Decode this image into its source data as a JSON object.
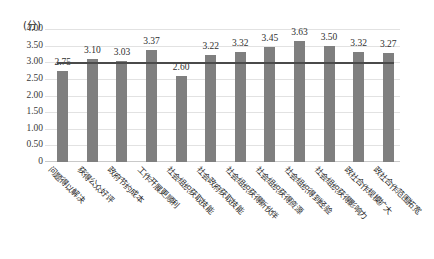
{
  "chart_data": {
    "type": "bar",
    "title": "",
    "subtitle": "",
    "xlabel": "",
    "ylabel": "(分)",
    "ylim": [
      0,
      4.0
    ],
    "grid": true,
    "legend": null,
    "categories": [
      "问题得以解决",
      "获得公众好评",
      "政府节约成本",
      "工作开展更顺利",
      "社会组织获取技能",
      "社会政府获取技能",
      "社会组织获得新伙伴",
      "社会组织获得资源",
      "社会组织得到经验",
      "社会组织获得影响力",
      "政社合作规模扩大",
      "政社合作范围拓宽"
    ],
    "values": [
      2.75,
      3.1,
      3.03,
      3.37,
      2.6,
      3.22,
      3.32,
      3.45,
      3.63,
      3.5,
      3.32,
      3.27
    ],
    "value_labels": [
      "2.75",
      "3.10",
      "3.03",
      "3.37",
      "2.60",
      "3.22",
      "3.32",
      "3.45",
      "3.63",
      "3.50",
      "3.32",
      "3.27"
    ],
    "yticks": [
      4.0,
      3.5,
      3.0,
      2.5,
      2.0,
      1.5,
      1.0,
      0.5,
      0
    ],
    "ytick_labels": [
      "4.00",
      "3.50",
      "3.00",
      "2.50",
      "2.00",
      "1.50",
      "1.00",
      "0.50",
      "0"
    ],
    "reference_line": {
      "value": 3.0,
      "label": "",
      "color": "#4a4a4a"
    },
    "series_color": "#7f7f7f",
    "background_color": "#ffffff",
    "gridline_color": "#e2e2e2"
  }
}
